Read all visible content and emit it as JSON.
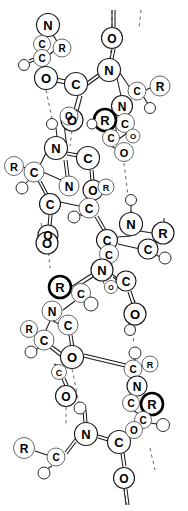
{
  "figure": {
    "kind": "ball-and-stick molecular model",
    "background_color": "#ffffff",
    "stroke_color": "#1a1a1a",
    "hydrogen_bond_color": "#555555",
    "labels_used": [
      "N",
      "C",
      "O",
      "R"
    ],
    "legend_note": ""
  },
  "atoms": [
    {
      "id": "a1",
      "label": "N",
      "x": 48,
      "y": 25,
      "r": 11.5,
      "style": "normal"
    },
    {
      "id": "a2",
      "label": "C",
      "x": 42,
      "y": 44,
      "r": 8.5,
      "style": "light"
    },
    {
      "id": "a3",
      "label": "C",
      "x": 42,
      "y": 58,
      "r": 8.5,
      "style": "light"
    },
    {
      "id": "a4",
      "label": "R",
      "x": 62,
      "y": 48,
      "r": 9.0,
      "style": "light"
    },
    {
      "id": "a5",
      "label": "",
      "x": 24,
      "y": 65,
      "r": 5.5,
      "style": "h"
    },
    {
      "id": "a6",
      "label": "O",
      "x": 46,
      "y": 78,
      "r": 11.5,
      "style": "normal"
    },
    {
      "id": "a7",
      "label": "C",
      "x": 76,
      "y": 84,
      "r": 11.5,
      "style": "normal"
    },
    {
      "id": "a8",
      "label": "O",
      "x": 72,
      "y": 120,
      "r": 11.0,
      "style": "normal"
    },
    {
      "id": "a9",
      "label": "O",
      "x": 112,
      "y": 38,
      "r": 10.5,
      "style": "normal"
    },
    {
      "id": "a10",
      "label": "N",
      "x": 109,
      "y": 70,
      "r": 11.5,
      "style": "normal"
    },
    {
      "id": "a11",
      "label": "C",
      "x": 137,
      "y": 91,
      "r": 9.0,
      "style": "light"
    },
    {
      "id": "a12",
      "label": "R",
      "x": 160,
      "y": 86,
      "r": 10.0,
      "style": "light"
    },
    {
      "id": "a13",
      "label": "",
      "x": 150,
      "y": 108,
      "r": 5.5,
      "style": "h"
    },
    {
      "id": "a14",
      "label": "N",
      "x": 122,
      "y": 106,
      "r": 10.5,
      "style": "normal"
    },
    {
      "id": "a15",
      "label": "C",
      "x": 125,
      "y": 123,
      "r": 9.5,
      "style": "light"
    },
    {
      "id": "a16",
      "label": "R",
      "x": 105,
      "y": 120,
      "r": 11.0,
      "style": "bold"
    },
    {
      "id": "a17",
      "label": "C",
      "x": 111,
      "y": 138,
      "r": 8.5,
      "style": "light"
    },
    {
      "id": "a18",
      "label": "O",
      "x": 124,
      "y": 152,
      "r": 9.5,
      "style": "light"
    },
    {
      "id": "a19",
      "label": "O",
      "x": 133,
      "y": 136,
      "r": 7.0,
      "style": "light"
    },
    {
      "id": "a20",
      "label": "",
      "x": 92,
      "y": 124,
      "r": 5.0,
      "style": "h"
    },
    {
      "id": "a21",
      "label": "",
      "x": 52,
      "y": 124,
      "r": 5.5,
      "style": "h"
    },
    {
      "id": "a22",
      "label": "O",
      "x": 69,
      "y": 116,
      "r": 9.0,
      "style": "light"
    },
    {
      "id": "a23",
      "label": "N",
      "x": 56,
      "y": 148,
      "r": 11.5,
      "style": "normal"
    },
    {
      "id": "a24",
      "label": "C",
      "x": 88,
      "y": 158,
      "r": 11.5,
      "style": "normal"
    },
    {
      "id": "a25",
      "label": "R",
      "x": 14,
      "y": 166,
      "r": 9.5,
      "style": "light"
    },
    {
      "id": "a26",
      "label": "C",
      "x": 34,
      "y": 172,
      "r": 10.0,
      "style": "light"
    },
    {
      "id": "a27",
      "label": "",
      "x": 22,
      "y": 188,
      "r": 6.0,
      "style": "h"
    },
    {
      "id": "a28",
      "label": "N",
      "x": 69,
      "y": 186,
      "r": 10.0,
      "style": "light"
    },
    {
      "id": "a29",
      "label": "O",
      "x": 93,
      "y": 190,
      "r": 10.0,
      "style": "normal"
    },
    {
      "id": "a30",
      "label": "C",
      "x": 50,
      "y": 204,
      "r": 10.5,
      "style": "normal"
    },
    {
      "id": "a31",
      "label": "O",
      "x": 48,
      "y": 235,
      "r": 10.0,
      "style": "normal"
    },
    {
      "id": "a32",
      "label": "R",
      "x": 106,
      "y": 187,
      "r": 8.0,
      "style": "light"
    },
    {
      "id": "a33",
      "label": "C",
      "x": 89,
      "y": 208,
      "r": 10.0,
      "style": "light"
    },
    {
      "id": "a34",
      "label": "",
      "x": 74,
      "y": 217,
      "r": 6.0,
      "style": "h"
    },
    {
      "id": "a35",
      "label": "",
      "x": 131,
      "y": 200,
      "r": 5.5,
      "style": "h"
    },
    {
      "id": "a36",
      "label": "N",
      "x": 131,
      "y": 224,
      "r": 11.5,
      "style": "normal"
    },
    {
      "id": "a37",
      "label": "C",
      "x": 107,
      "y": 240,
      "r": 10.5,
      "style": "normal"
    },
    {
      "id": "a38",
      "label": "R",
      "x": 163,
      "y": 233,
      "r": 11.0,
      "style": "normal"
    },
    {
      "id": "a39",
      "label": "C",
      "x": 148,
      "y": 249,
      "r": 10.0,
      "style": "normal"
    },
    {
      "id": "a40",
      "label": "",
      "x": 165,
      "y": 258,
      "r": 6.0,
      "style": "h"
    },
    {
      "id": "a41",
      "label": "O",
      "x": 47,
      "y": 243,
      "r": 11.0,
      "style": "normal"
    },
    {
      "id": "a42",
      "label": "C",
      "x": 109,
      "y": 254,
      "r": 9.5,
      "style": "light"
    },
    {
      "id": "a43",
      "label": "N",
      "x": 102,
      "y": 270,
      "r": 11.0,
      "style": "normal"
    },
    {
      "id": "a44",
      "label": "C",
      "x": 126,
      "y": 281,
      "r": 10.0,
      "style": "normal"
    },
    {
      "id": "a45",
      "label": "O",
      "x": 111,
      "y": 287,
      "r": 6.5,
      "style": "light"
    },
    {
      "id": "a46",
      "label": "R",
      "x": 60,
      "y": 287,
      "r": 11.0,
      "style": "bold"
    },
    {
      "id": "a47",
      "label": "C",
      "x": 81,
      "y": 293,
      "r": 9.5,
      "style": "light"
    },
    {
      "id": "a48",
      "label": "",
      "x": 91,
      "y": 304,
      "r": 7.0,
      "style": "h"
    },
    {
      "id": "a49",
      "label": "O",
      "x": 135,
      "y": 314,
      "r": 11.0,
      "style": "normal"
    },
    {
      "id": "a50",
      "label": "N",
      "x": 52,
      "y": 311,
      "r": 10.0,
      "style": "light"
    },
    {
      "id": "a51",
      "label": "R",
      "x": 29,
      "y": 329,
      "r": 8.5,
      "style": "light"
    },
    {
      "id": "a52",
      "label": "C",
      "x": 44,
      "y": 340,
      "r": 10.0,
      "style": "light"
    },
    {
      "id": "a53",
      "label": "C",
      "x": 68,
      "y": 325,
      "r": 10.0,
      "style": "light"
    },
    {
      "id": "a54",
      "label": "",
      "x": 31,
      "y": 352,
      "r": 6.0,
      "style": "h"
    },
    {
      "id": "a55",
      "label": "",
      "x": 130,
      "y": 330,
      "r": 5.5,
      "style": "h"
    },
    {
      "id": "a56",
      "label": "O",
      "x": 72,
      "y": 357,
      "r": 11.5,
      "style": "normal"
    },
    {
      "id": "a57",
      "label": "C",
      "x": 59,
      "y": 372,
      "r": 7.5,
      "style": "light"
    },
    {
      "id": "a58",
      "label": "O",
      "x": 66,
      "y": 396,
      "r": 10.5,
      "style": "normal"
    },
    {
      "id": "a59",
      "label": "C",
      "x": 133,
      "y": 369,
      "r": 9.0,
      "style": "light"
    },
    {
      "id": "a60",
      "label": "R",
      "x": 150,
      "y": 364,
      "r": 8.0,
      "style": "light"
    },
    {
      "id": "a61",
      "label": "",
      "x": 135,
      "y": 353,
      "r": 6.0,
      "style": "h"
    },
    {
      "id": "a62",
      "label": "N",
      "x": 137,
      "y": 386,
      "r": 10.0,
      "style": "normal"
    },
    {
      "id": "a63",
      "label": "C",
      "x": 131,
      "y": 403,
      "r": 8.5,
      "style": "light"
    },
    {
      "id": "a64",
      "label": "R",
      "x": 152,
      "y": 404,
      "r": 11.0,
      "style": "bold"
    },
    {
      "id": "a65",
      "label": "C",
      "x": 143,
      "y": 420,
      "r": 8.5,
      "style": "light"
    },
    {
      "id": "a66",
      "label": "",
      "x": 163,
      "y": 425,
      "r": 6.5,
      "style": "h"
    },
    {
      "id": "a67",
      "label": "",
      "x": 80,
      "y": 408,
      "r": 6.0,
      "style": "h"
    },
    {
      "id": "a68",
      "label": "N",
      "x": 86,
      "y": 434,
      "r": 11.5,
      "style": "normal"
    },
    {
      "id": "a69",
      "label": "C",
      "x": 119,
      "y": 442,
      "r": 11.5,
      "style": "normal"
    },
    {
      "id": "a70",
      "label": "O",
      "x": 134,
      "y": 430,
      "r": 8.5,
      "style": "light"
    },
    {
      "id": "a71",
      "label": "R",
      "x": 24,
      "y": 448,
      "r": 10.5,
      "style": "light"
    },
    {
      "id": "a72",
      "label": "C",
      "x": 56,
      "y": 457,
      "r": 9.0,
      "style": "light"
    },
    {
      "id": "a73",
      "label": "",
      "x": 44,
      "y": 473,
      "r": 6.0,
      "style": "h"
    },
    {
      "id": "a74",
      "label": "O",
      "x": 124,
      "y": 478,
      "r": 10.5,
      "style": "normal"
    }
  ],
  "bonds_count": 96,
  "hydrogen_bonds_count": 9
}
